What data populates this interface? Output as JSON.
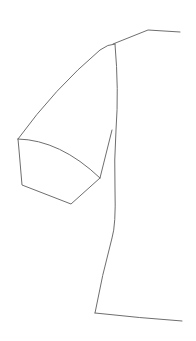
{
  "diagram": {
    "type": "garment-flat-sketch",
    "stroke_color": "#6e6e6e",
    "background": "#ffffff",
    "parts": [
      {
        "name": "neckline-shoulder",
        "d": "M113,44 L148,30 L180,32"
      },
      {
        "name": "sleeve-cap",
        "d": "M115,44 Q108,44 100,50 Q55,88 18,139"
      },
      {
        "name": "body-side-seam",
        "d": "M115,44 Q119,90 116,130 Q114,160 115,190 Q116,225 112,238 Q102,275 95,313"
      },
      {
        "name": "sleeve-underarm-seam",
        "d": "M18,139 Q60,140 100,178"
      },
      {
        "name": "sleeve-cuff",
        "d": "M18,139 L19,150 L22,185 L71,204 L100,178"
      },
      {
        "name": "armhole-front",
        "d": "M100,178 L112,130"
      },
      {
        "name": "hem",
        "d": "M95,313 Q140,318 182,321"
      }
    ]
  }
}
